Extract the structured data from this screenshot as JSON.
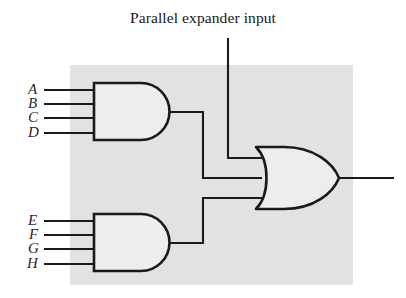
{
  "figure": {
    "caption": "Parallel expander input",
    "background_color": "#ffffff",
    "shaded_region_color": "#e2e2e2",
    "wire_color": "#1a1a1a",
    "gate_fill_color": "#ededed"
  },
  "diagram": {
    "type": "logic-gate-schematic",
    "gates": [
      {
        "id": "and-gate-top",
        "type": "AND",
        "inputs": [
          "A",
          "B",
          "C",
          "D"
        ],
        "output_to": "or-gate"
      },
      {
        "id": "and-gate-bottom",
        "type": "AND",
        "inputs": [
          "E",
          "F",
          "G",
          "H"
        ],
        "output_to": "or-gate"
      },
      {
        "id": "or-gate",
        "type": "OR",
        "inputs": [
          "parallel expander input",
          "and-gate-top",
          "and-gate-bottom"
        ],
        "output_to": "output"
      }
    ],
    "input_labels_top": [
      "A",
      "B",
      "C",
      "D"
    ],
    "input_labels_bottom": [
      "E",
      "F",
      "G",
      "H"
    ],
    "expander_input_label": "Parallel expander input",
    "output_label": ""
  },
  "labels": {
    "a": "A",
    "b": "B",
    "c": "C",
    "d": "D",
    "e": "E",
    "f": "F",
    "g": "G",
    "h": "H"
  }
}
